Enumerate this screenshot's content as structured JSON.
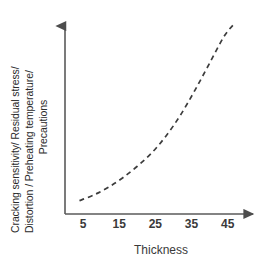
{
  "chart_data": {
    "type": "line",
    "title": "",
    "subtitle": "",
    "xlabel": "Thickness",
    "ylabel_lines": [
      "Cracking sensitivity/ Residual stress/",
      "Distortion / Preheating temperature/",
      "Precautions"
    ],
    "ylabel": "Cracking sensitivity/ Residual stress/ Distortion / Preheating temperature/ Precautions",
    "xticks": [
      5,
      15,
      25,
      35,
      45
    ],
    "xtick_labels": [
      "5",
      "15",
      "25",
      "35",
      "45"
    ],
    "yticks": [],
    "ytick_labels": [],
    "xlim": [
      0,
      52
    ],
    "ylim": [
      0,
      1
    ],
    "grid": false,
    "legend": false,
    "legend_position": "none",
    "annotations": [],
    "series": [
      {
        "name": "cracking-sensitivity-trend",
        "style": "dashed",
        "color": "#3c3c3c",
        "x": [
          4,
          8,
          12,
          16,
          20,
          24,
          28,
          32,
          36,
          40,
          44,
          47
        ],
        "y": [
          0.07,
          0.1,
          0.14,
          0.19,
          0.25,
          0.32,
          0.41,
          0.52,
          0.65,
          0.79,
          0.93,
          1.0
        ]
      }
    ]
  },
  "axes": {
    "x_axis_name": "x-axis",
    "y_axis_name": "y-axis",
    "arrow_heads": true,
    "axis_color": "#555555"
  },
  "colors": {
    "background": "#ffffff",
    "axis": "#555555",
    "curve": "#3c3c3c",
    "text": "#2b2b2b"
  }
}
